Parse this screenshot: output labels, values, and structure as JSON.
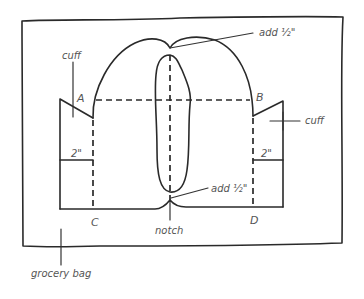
{
  "diagram": {
    "labels": {
      "cuff_left": "cuff",
      "cuff_right": "cuff",
      "point_a": "A",
      "point_b": "B",
      "point_c": "C",
      "point_d": "D",
      "add_top": "add ½\"",
      "add_bottom": "add ½\"",
      "two_inch_left": "2\"",
      "two_inch_right": "2\"",
      "notch": "notch",
      "grocery_bag": "grocery bag"
    },
    "colors": {
      "ink": "#2a2a2a",
      "label": "#555555",
      "background": "#ffffff"
    }
  }
}
